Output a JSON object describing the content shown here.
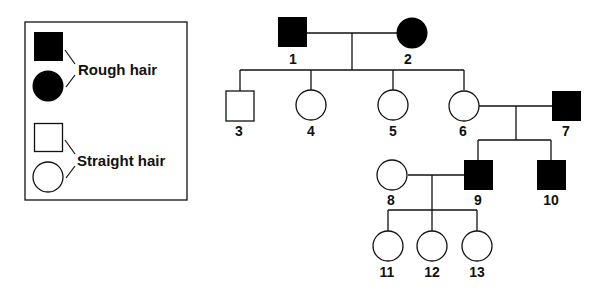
{
  "legend": {
    "affected_label": "Rough hair",
    "unaffected_label": "Straight hair"
  },
  "individuals": [
    {
      "id": "1",
      "sex": "male",
      "phenotype": "rough"
    },
    {
      "id": "2",
      "sex": "female",
      "phenotype": "rough"
    },
    {
      "id": "3",
      "sex": "male",
      "phenotype": "straight"
    },
    {
      "id": "4",
      "sex": "female",
      "phenotype": "straight"
    },
    {
      "id": "5",
      "sex": "female",
      "phenotype": "straight"
    },
    {
      "id": "6",
      "sex": "female",
      "phenotype": "straight"
    },
    {
      "id": "7",
      "sex": "male",
      "phenotype": "rough"
    },
    {
      "id": "8",
      "sex": "female",
      "phenotype": "straight"
    },
    {
      "id": "9",
      "sex": "male",
      "phenotype": "rough"
    },
    {
      "id": "10",
      "sex": "male",
      "phenotype": "rough"
    },
    {
      "id": "11",
      "sex": "female",
      "phenotype": "straight"
    },
    {
      "id": "12",
      "sex": "female",
      "phenotype": "straight"
    },
    {
      "id": "13",
      "sex": "female",
      "phenotype": "straight"
    }
  ],
  "couples": [
    {
      "partners": [
        "1",
        "2"
      ],
      "children": [
        "3",
        "4",
        "5",
        "6"
      ]
    },
    {
      "partners": [
        "6",
        "7"
      ],
      "children": [
        "9",
        "10"
      ]
    },
    {
      "partners": [
        "8",
        "9"
      ],
      "children": [
        "11",
        "12",
        "13"
      ]
    }
  ],
  "colors": {
    "affected_fill": "#000000",
    "unaffected_fill": "#ffffff",
    "stroke": "#111111"
  }
}
